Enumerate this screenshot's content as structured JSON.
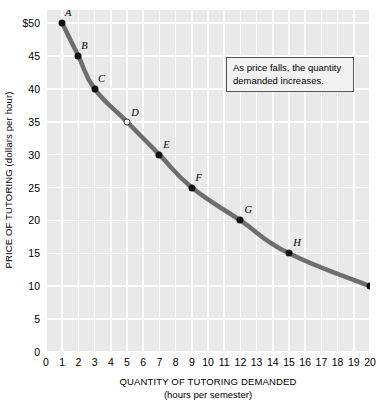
{
  "chart_data": {
    "type": "line",
    "title": "",
    "subtitle": "",
    "xlabel": "QUANTITY OF TUTORING DEMANDED",
    "xlabel_sub": "(hours per semester)",
    "ylabel": "PRICE OF TUTORING (dollars per hour)",
    "xlim": [
      0,
      20
    ],
    "ylim": [
      0,
      52
    ],
    "grid": true,
    "legend": "none",
    "x_ticks": [
      0,
      1,
      2,
      3,
      4,
      5,
      6,
      7,
      8,
      9,
      10,
      11,
      12,
      13,
      14,
      15,
      16,
      17,
      18,
      19,
      20
    ],
    "x_tick_labels": [
      "0",
      "1",
      "2",
      "3",
      "4",
      "5",
      "6",
      "7",
      "8",
      "9",
      "10",
      "11",
      "12",
      "13",
      "14",
      "15",
      "16",
      "17",
      "18",
      "19",
      "20"
    ],
    "y_ticks": [
      0,
      5,
      10,
      15,
      20,
      25,
      30,
      35,
      40,
      45,
      50
    ],
    "y_tick_labels": [
      "0",
      "5",
      "10",
      "15",
      "20",
      "25",
      "30",
      "35",
      "40",
      "45",
      "$50"
    ],
    "series": [
      {
        "name": "Demand",
        "x": [
          1,
          2,
          3,
          5,
          7,
          9,
          12,
          15,
          20
        ],
        "values": [
          50,
          45,
          40,
          35,
          30,
          25,
          20,
          15,
          10
        ],
        "point_labels": [
          "A",
          "B",
          "C",
          "D",
          "E",
          "F",
          "G",
          "H",
          "I"
        ],
        "marker_styles": [
          "filled",
          "filled",
          "filled",
          "hollow",
          "filled",
          "filled",
          "filled",
          "filled",
          "filled"
        ],
        "line_color": "#6e6e6e",
        "marker_color": "#111111"
      }
    ],
    "points": [
      {
        "label": "A",
        "x": 1,
        "y": 50,
        "marker": "filled",
        "label_dx": 6,
        "label_dy": -11
      },
      {
        "label": "B",
        "x": 2,
        "y": 45,
        "marker": "filled",
        "label_dx": 6,
        "label_dy": -11
      },
      {
        "label": "C",
        "x": 3,
        "y": 40,
        "marker": "filled",
        "label_dx": 7,
        "label_dy": -11
      },
      {
        "label": "D",
        "x": 5,
        "y": 35,
        "marker": "hollow",
        "label_dx": 8,
        "label_dy": -10
      },
      {
        "label": "E",
        "x": 7,
        "y": 30,
        "marker": "filled",
        "label_dx": 7,
        "label_dy": -11
      },
      {
        "label": "F",
        "x": 9,
        "y": 25,
        "marker": "filled",
        "label_dx": 7,
        "label_dy": -11
      },
      {
        "label": "G",
        "x": 12,
        "y": 20,
        "marker": "filled",
        "label_dx": 8,
        "label_dy": -11
      },
      {
        "label": "H",
        "x": 15,
        "y": 15,
        "marker": "filled",
        "label_dx": 8,
        "label_dy": -11
      },
      {
        "label": "I",
        "x": 20,
        "y": 10,
        "marker": "filled",
        "label_dx": 6,
        "label_dy": -11
      }
    ],
    "annotations": [
      {
        "name": "demand-callout",
        "line1": "As price falls, the quantity",
        "line2": "demanded increases."
      }
    ],
    "colors": {
      "plot_background": "#e9e9e9",
      "gridline": "#ffffff",
      "curve": "#6e6e6e",
      "marker": "#111111",
      "annotation_border": "#555555",
      "annotation_background": "#f2f2f2",
      "text": "#000000"
    }
  }
}
